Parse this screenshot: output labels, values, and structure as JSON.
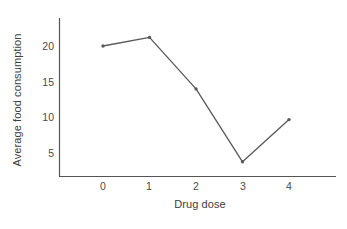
{
  "chart_data": {
    "type": "line",
    "title": "",
    "xlabel": "Drug dose",
    "ylabel": "Average food consumption",
    "categories": [
      "0",
      "1",
      "2",
      "3",
      "4"
    ],
    "x": [
      0,
      1,
      2,
      3,
      4
    ],
    "values": [
      20,
      21.2,
      14,
      3.8,
      9.7
    ],
    "series": [
      {
        "name": "Average food consumption",
        "values": [
          20,
          21.2,
          14,
          3.8,
          9.7
        ]
      }
    ],
    "xlim": [
      -0.5,
      4.6
    ],
    "ylim": [
      0,
      24
    ],
    "yticks": [
      5,
      10,
      15,
      20
    ],
    "ytick_labels": [
      "5",
      "10",
      "15",
      "20"
    ],
    "xticks": [
      0,
      1,
      2,
      3,
      4
    ],
    "xtick_labels": [
      "0",
      "1",
      "2",
      "3",
      "4"
    ],
    "grid": false,
    "legend": false,
    "legend_position": "none",
    "marker": "dot",
    "line_color": "#595959",
    "axis_color": "#555555",
    "text_color": "#3d3d3d",
    "background_color": "#ffffff"
  },
  "axes": {
    "y": {
      "title": "Average food consumption",
      "ticks": [
        "20",
        "15",
        "10",
        "5"
      ]
    },
    "x": {
      "title": "Drug dose",
      "ticks": [
        "0",
        "1",
        "2",
        "3",
        "4"
      ]
    }
  }
}
